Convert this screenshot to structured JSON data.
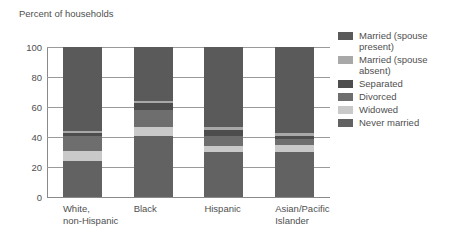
{
  "chart_data": {
    "type": "bar",
    "subtype": "stacked-bar",
    "title": "Percent of households",
    "ylabel": "Percent of households",
    "xlabel": "",
    "ylim": [
      0,
      100
    ],
    "yticks": [
      0,
      20,
      40,
      60,
      80,
      100
    ],
    "ytick_labels": [
      "0",
      "20",
      "40",
      "60",
      "80",
      "100"
    ],
    "grid": true,
    "grid_axis": "y",
    "legend_position": "right",
    "stack_order_bottom_to_top": [
      "Never married",
      "Widowed",
      "Divorced",
      "Separated",
      "Married (spouse absent)",
      "Married (spouse present)"
    ],
    "categories": [
      "White,\nnon-Hispanic",
      "Black",
      "Hispanic",
      "Asian/Pacific\nIslander"
    ],
    "series": [
      {
        "name": "Married (spouse present)",
        "color": "#5a5a5a",
        "values": [
          56.0,
          36.0,
          53.0,
          57.5
        ]
      },
      {
        "name": "Married (spouse absent)",
        "color": "#a8a8a8",
        "values": [
          1.5,
          1.5,
          2.0,
          2.0
        ]
      },
      {
        "name": "Separated",
        "color": "#4d4d4d",
        "values": [
          2.0,
          4.5,
          4.0,
          2.0
        ]
      },
      {
        "name": "Divorced",
        "color": "#6e6e6e",
        "values": [
          9.5,
          11.0,
          7.0,
          4.0
        ]
      },
      {
        "name": "Widowed",
        "color": "#c9c9c9",
        "values": [
          7.0,
          6.0,
          4.0,
          4.5
        ]
      },
      {
        "name": "Never married",
        "color": "#626262",
        "values": [
          24.0,
          41.0,
          30.0,
          30.0
        ]
      }
    ]
  },
  "legend": {
    "items": [
      {
        "label": "Married (spouse\npresent)",
        "color": "#5a5a5a"
      },
      {
        "label": "Married (spouse\nabsent)",
        "color": "#a8a8a8"
      },
      {
        "label": "Separated",
        "color": "#4d4d4d"
      },
      {
        "label": "Divorced",
        "color": "#6e6e6e"
      },
      {
        "label": "Widowed",
        "color": "#c9c9c9"
      },
      {
        "label": "Never married",
        "color": "#626262"
      }
    ]
  },
  "colors": {
    "background": "#ffffff",
    "text": "#4f4f4f",
    "gridline": "#9a9a9a",
    "axis": "#8a8a8a"
  }
}
